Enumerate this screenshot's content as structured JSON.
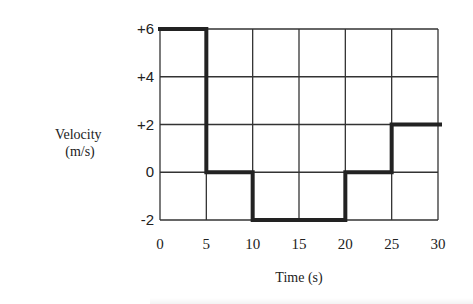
{
  "chart_data": {
    "type": "line",
    "subtype": "step",
    "title": "",
    "xlabel": "Time (s)",
    "ylabel": "Velocity\n(m/s)",
    "ylabel_lines": [
      "Velocity",
      "(m/s)"
    ],
    "xlim": [
      0,
      30
    ],
    "ylim": [
      -2,
      6
    ],
    "x_ticks": [
      0,
      5,
      10,
      15,
      20,
      25,
      30
    ],
    "x_tick_labels": [
      "0",
      "5",
      "10",
      "15",
      "20",
      "25",
      "30"
    ],
    "y_ticks": [
      -2,
      0,
      2,
      4,
      6
    ],
    "y_tick_labels": [
      "-2",
      "0",
      "+2",
      "+4",
      "+6"
    ],
    "grid": true,
    "legend": "none",
    "series": [
      {
        "name": "velocity",
        "segments": [
          {
            "x_start": 0,
            "x_end": 5,
            "y": 6
          },
          {
            "x_start": 5,
            "x_end": 10,
            "y": 0
          },
          {
            "x_start": 10,
            "x_end": 20,
            "y": -2
          },
          {
            "x_start": 20,
            "x_end": 25,
            "y": 0
          },
          {
            "x_start": 25,
            "x_end": 30,
            "y": 2
          }
        ]
      }
    ]
  }
}
